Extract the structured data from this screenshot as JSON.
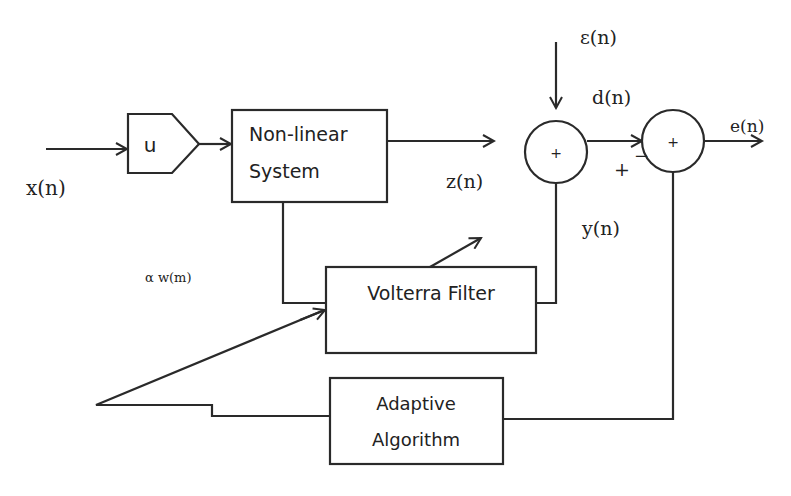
{
  "blocks": {
    "gain": "u",
    "nonlinear_line1": "Non-linear",
    "nonlinear_line2": "System",
    "volterra": "Volterra Filter",
    "adaptive_line1": "Adaptive",
    "adaptive_line2": "Algorithm",
    "sum1_sign": "+",
    "sum2_sign": "+"
  },
  "signals": {
    "input": "x(n)",
    "system_output": "z(n)",
    "noise": "ε(n)",
    "desired": "d(n)",
    "filter_output": "y(n)",
    "error": "e(n)",
    "weights": "α w(m)",
    "plus_sign": "+",
    "minus_sign": "−"
  }
}
